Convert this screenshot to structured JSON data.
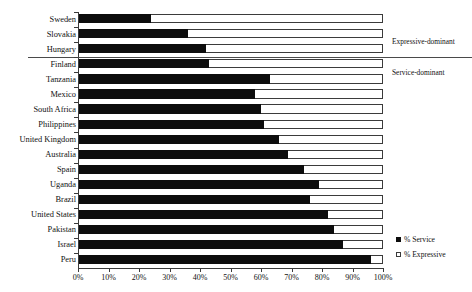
{
  "chart_data": {
    "type": "bar",
    "orientation": "horizontal",
    "stacked": false,
    "title": "",
    "subtitle": "",
    "xlabel": "",
    "ylabel": "",
    "xlim": [
      0,
      100
    ],
    "xticks": [
      "0%",
      "10%",
      "20%",
      "30%",
      "40%",
      "50%",
      "60%",
      "70%",
      "80%",
      "90%",
      "100%"
    ],
    "xtick_values": [
      0,
      10,
      20,
      30,
      40,
      50,
      60,
      70,
      80,
      90,
      100
    ],
    "grid": false,
    "legend_position": "right-bottom",
    "categories": [
      "Sweden",
      "Slovakia",
      "Hungary",
      "Finland",
      "Tanzania",
      "Mexico",
      "South Africa",
      "Philippines",
      "United Kingdom",
      "Australia",
      "Spain",
      "Uganda",
      "Brazil",
      "United States",
      "Pakistan",
      "Israel",
      "Peru"
    ],
    "series": [
      {
        "name": "% Service",
        "marker": "filled-square",
        "color": "#0d0d0d",
        "values": [
          24,
          36,
          42,
          43,
          63,
          58,
          60,
          61,
          66,
          69,
          74,
          79,
          76,
          82,
          84,
          87,
          96
        ]
      },
      {
        "name": "% Expressive",
        "marker": "hollow-square",
        "color": "#ffffff",
        "values": [
          100,
          100,
          100,
          100,
          100,
          100,
          100,
          100,
          100,
          100,
          100,
          100,
          100,
          100,
          100,
          100,
          100
        ]
      }
    ],
    "annotations": [
      {
        "text": "Expressive-dominant",
        "group_categories": [
          "Sweden",
          "Slovakia",
          "Hungary"
        ]
      },
      {
        "text": "Service-dominant",
        "group_categories": [
          "Finland",
          "Tanzania",
          "Mexico",
          "South Africa",
          "Philippines",
          "United Kingdom",
          "Australia",
          "Spain",
          "Uganda",
          "Brazil",
          "United States",
          "Pakistan",
          "Israel",
          "Peru"
        ]
      }
    ],
    "divider_after_category": "Hungary"
  },
  "legend": {
    "items": [
      {
        "label": "% Service",
        "swatch": "filled-square"
      },
      {
        "label": "% Expressive",
        "swatch": "hollow-square"
      }
    ]
  },
  "annotations": {
    "expressive_dominant": "Expressive-dominant",
    "service_dominant": "Service-dominant"
  },
  "colors": {
    "service": "#0d0d0d",
    "expressive": "#ffffff",
    "axis": "#3b3b3b",
    "divider": "#4a4a4a",
    "text": "#111111",
    "background": "#ffffff"
  }
}
